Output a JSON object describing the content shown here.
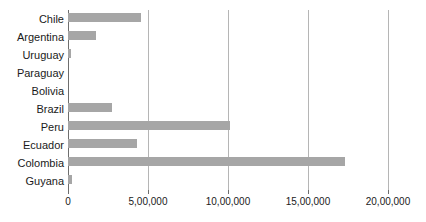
{
  "chart_data": {
    "type": "bar",
    "orientation": "horizontal",
    "title": "",
    "xlabel": "",
    "ylabel": "",
    "xlim": [
      0,
      2000000
    ],
    "grid": true,
    "legend": false,
    "bar_color": "#a6a6a6",
    "xtick_labels": [
      "0",
      "5,00,000",
      "10,00,000",
      "15,00,000",
      "20,00,000"
    ],
    "xtick_values": [
      0,
      500000,
      1000000,
      1500000,
      2000000
    ],
    "categories": [
      "Chile",
      "Argentina",
      "Uruguay",
      "Paraguay",
      "Bolivia",
      "Brazil",
      "Peru",
      "Ecuador",
      "Colombia",
      "Guyana"
    ],
    "values": [
      456000,
      175000,
      19000,
      0,
      0,
      275000,
      1012000,
      431000,
      1731000,
      25000
    ]
  }
}
